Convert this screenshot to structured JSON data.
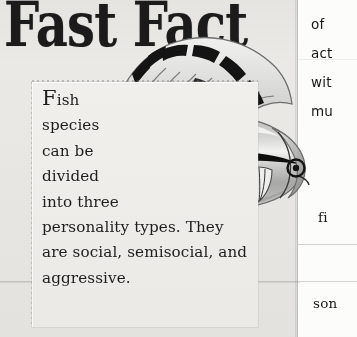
{
  "page": {
    "background_color": "#e9e8e5",
    "ink_color": "#1b1b1b",
    "right_column_color": "#fdfdfc"
  },
  "headline": {
    "text": "Fast Fact"
  },
  "inset": {
    "dropcap": "F",
    "lines": [
      "ish",
      "species",
      "can be",
      "divided",
      "into three",
      "personality types. They",
      "are social, semisocial, and",
      "aggressive."
    ],
    "full_text": "Fish species can be divided into three personality types. They are social, semisocial, and aggressive."
  },
  "right_column": {
    "lines": [
      "of",
      "act",
      "wit",
      "mu",
      "fi",
      "son"
    ]
  },
  "illustration": {
    "subject": "tropical fish",
    "body_fill": "#c9c9c7",
    "stripe_color": "#111111",
    "eye_color": "#0d0d0d",
    "fin_outline": "#6f6f6d",
    "highlight": "#f6f6f4"
  }
}
